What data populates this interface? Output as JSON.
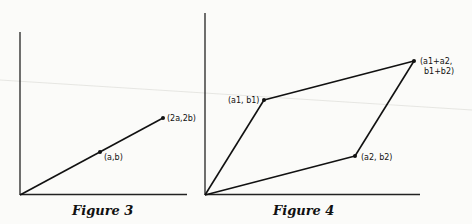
{
  "figures": [
    {
      "caption": "Figure 3",
      "points": [
        {
          "label": "(a,b)",
          "x": 100,
          "y": 152
        },
        {
          "label": "(2a,2b)",
          "x": 163,
          "y": 118
        }
      ]
    },
    {
      "caption": "Figure 4",
      "points": [
        {
          "label": "(a1, b1)",
          "x": 264,
          "y": 100
        },
        {
          "label": "(a2, b2)",
          "x": 355,
          "y": 156
        },
        {
          "label_line1": "(a1+a2,",
          "label_line2": "b1+b2)",
          "x": 414,
          "y": 61
        }
      ]
    }
  ]
}
